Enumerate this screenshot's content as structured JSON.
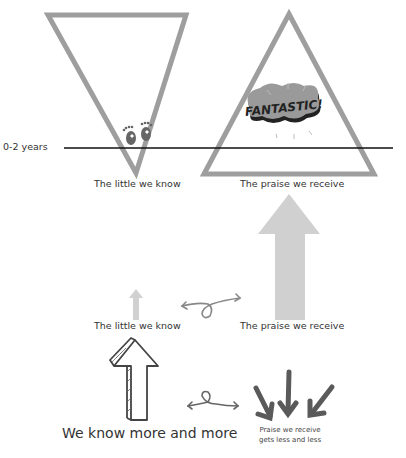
{
  "top_section": {
    "timeline_label": "0-2 years",
    "left_triangle_label": "The little we know",
    "right_triangle_label": "The praise we receive",
    "badge_text": "FANTASTIC!"
  },
  "middle_section": {
    "left_label": "The little we know",
    "right_label": "The praise we receive"
  },
  "bottom_section": {
    "left_label": "We know more and more",
    "right_label_line1": "Praise we receive",
    "right_label_line2": "gets less and less"
  },
  "colors": {
    "triangle_stroke": "#9e9e9e",
    "arrow_fill": "#d0d0d0",
    "dark_arrow": "#555555",
    "timeline": "#111111"
  }
}
